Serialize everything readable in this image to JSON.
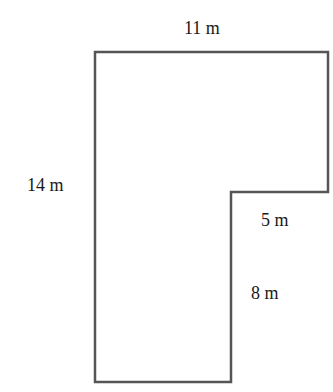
{
  "diagram": {
    "shape": "L-shaped polygon",
    "stroke_color": "#555555",
    "labels": {
      "top": "11 m",
      "left": "14 m",
      "notch_horizontal": "5 m",
      "notch_vertical": "8 m"
    }
  }
}
